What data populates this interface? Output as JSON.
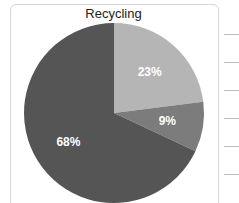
{
  "chart_data": {
    "type": "pie",
    "title": "Recycling",
    "categories": [
      "Slice A",
      "Slice B",
      "Slice C"
    ],
    "values": [
      23,
      9,
      68
    ],
    "labels": [
      "23%",
      "9%",
      "68%"
    ],
    "colors": [
      "#b5b5b5",
      "#7c7c7c",
      "#555555"
    ],
    "start_angle_deg": 90,
    "direction": "clockwise",
    "legend": "none"
  },
  "right_rules_count": 6
}
